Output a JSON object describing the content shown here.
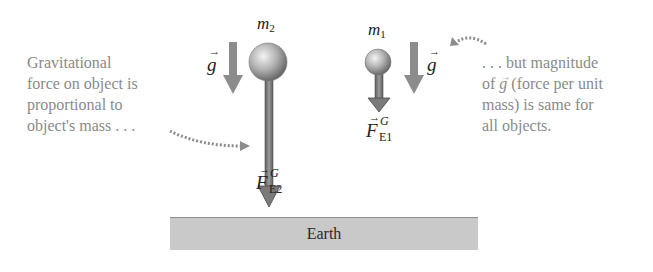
{
  "left_note": {
    "lines": [
      "Gravitational",
      "force on object is",
      "proportional to",
      "object's mass . . ."
    ]
  },
  "right_note": {
    "lines": [
      ". . . but magnitude",
      "of g (force per unit",
      "mass) is same for",
      "all objects."
    ],
    "line2_prefix": "of ",
    "line2_vec": "g",
    "line2_suffix": " (force per unit"
  },
  "objects": [
    {
      "id": "m2",
      "label": "m",
      "subscript": "2",
      "force_label": "F",
      "force_sup": "G",
      "force_sub": "E2"
    },
    {
      "id": "m1",
      "label": "m",
      "subscript": "1",
      "force_label": "F",
      "force_sup": "G",
      "force_sub": "E1"
    }
  ],
  "g_label": "g",
  "vector_arrow": "→",
  "ground": {
    "label": "Earth"
  },
  "colors": {
    "arrow_gray": "#8c8c8c",
    "arrow_dark": "#6e6e6e",
    "note_text": "#8a8a8a",
    "ground_fill": "#c9c9c9"
  }
}
